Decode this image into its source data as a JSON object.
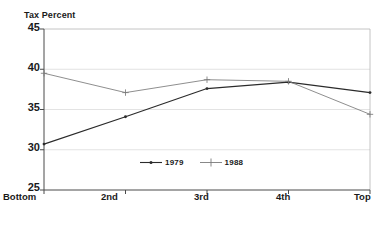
{
  "chart_data": {
    "type": "line",
    "title": "",
    "xlabel": "Income Quintile",
    "ylabel": "Tax Percent",
    "categories": [
      "Bottom",
      "2nd",
      "3rd",
      "4th",
      "Top"
    ],
    "ylim": [
      25,
      45
    ],
    "yticks": [
      25,
      30,
      35,
      40,
      45
    ],
    "grid": true,
    "legend_position": "inside-bottom-center",
    "series": [
      {
        "name": "1979",
        "marker": "dot",
        "color": "#2b2b2b",
        "values": [
          30.7,
          34.1,
          37.6,
          38.4,
          37.1
        ]
      },
      {
        "name": "1988",
        "marker": "plus",
        "color": "#7a7a7a",
        "values": [
          39.5,
          37.1,
          38.7,
          38.5,
          34.4
        ]
      }
    ]
  },
  "axes": {
    "y_title": "Tax Percent",
    "x_title": "Income Quintile",
    "y_tick_labels": [
      "45",
      "40",
      "35",
      "30",
      "25"
    ],
    "x_tick_labels": [
      "Bottom",
      "2nd",
      "3rd",
      "4th",
      "Top"
    ]
  },
  "legend": {
    "items": [
      {
        "label": "1979",
        "marker": "dot-line-marker",
        "color": "#2b2b2b"
      },
      {
        "label": "1988",
        "marker": "plus-line-marker",
        "color": "#7a7a7a"
      }
    ]
  },
  "colors": {
    "series_1979": "#2b2b2b",
    "series_1988": "#7a7a7a",
    "axis": "#4a4a4a",
    "grid": "#dcdcdc",
    "background": "#ffffff"
  }
}
